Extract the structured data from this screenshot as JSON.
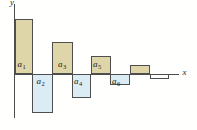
{
  "chart_data": {
    "type": "bar",
    "title": "",
    "xlabel": "x",
    "ylabel": "y",
    "grid": false,
    "legend": "none",
    "categories": [
      "a1",
      "a2",
      "a3",
      "a4",
      "a5",
      "a6",
      "",
      ""
    ],
    "values_normalized": [
      1.0,
      -0.71,
      0.58,
      -0.43,
      0.34,
      -0.19,
      0.16,
      -0.08
    ],
    "colors": {
      "positive_fill": "#ded6a8",
      "negative_fill": "#dcecf4",
      "empty_fill": "#ffffff",
      "outline": "#4f4f4f",
      "axis": "#4d4d4d",
      "label": "#1b1b1b"
    },
    "axis": {
      "x_axis_y_px": 74,
      "x_axis_start_px": 13.5,
      "x_axis_end_px": 178.5,
      "y_axis_x_px": 13.5,
      "y_axis_top_px": 3.5,
      "y_axis_bottom_px": 118,
      "x_label_pos_px": [
        182.5,
        68
      ],
      "y_label_pos_px": [
        10,
        -2
      ]
    },
    "bars": [
      {
        "name": "a1",
        "label_base": "a",
        "label_sub": "1",
        "x_px": 14.5,
        "width_px": 18.5,
        "signed_height_px": 55,
        "fill": "positive_fill",
        "label_x_px": 17.5,
        "label_y_px": 60
      },
      {
        "name": "a2",
        "label_base": "a",
        "label_sub": "2",
        "x_px": 32,
        "width_px": 21,
        "signed_height_px": -39,
        "fill": "negative_fill",
        "label_x_px": 36.5,
        "label_y_px": 77
      },
      {
        "name": "a3",
        "label_base": "a",
        "label_sub": "3",
        "x_px": 52,
        "width_px": 20.5,
        "signed_height_px": 32,
        "fill": "positive_fill",
        "label_x_px": 58,
        "label_y_px": 60
      },
      {
        "name": "a4",
        "label_base": "a",
        "label_sub": "4",
        "x_px": 71.5,
        "width_px": 19.5,
        "signed_height_px": -23.5,
        "fill": "negative_fill",
        "label_x_px": 74,
        "label_y_px": 77
      },
      {
        "name": "a5",
        "label_base": "a",
        "label_sub": "5",
        "x_px": 90.5,
        "width_px": 20,
        "signed_height_px": 18.5,
        "fill": "positive_fill",
        "label_x_px": 93,
        "label_y_px": 60
      },
      {
        "name": "a6",
        "label_base": "a",
        "label_sub": "6",
        "x_px": 110,
        "width_px": 20,
        "signed_height_px": -10.5,
        "fill": "negative_fill",
        "label_x_px": 112,
        "label_y_px": 77
      },
      {
        "name": "term7",
        "label_base": "",
        "label_sub": "",
        "x_px": 129.5,
        "width_px": 20.5,
        "signed_height_px": 9,
        "fill": "positive_fill",
        "label_x_px": 0,
        "label_y_px": 0
      },
      {
        "name": "term8",
        "label_base": "",
        "label_sub": "",
        "x_px": 149.5,
        "width_px": 19,
        "signed_height_px": -4.5,
        "fill": "empty_fill",
        "label_x_px": 0,
        "label_y_px": 0
      }
    ]
  }
}
